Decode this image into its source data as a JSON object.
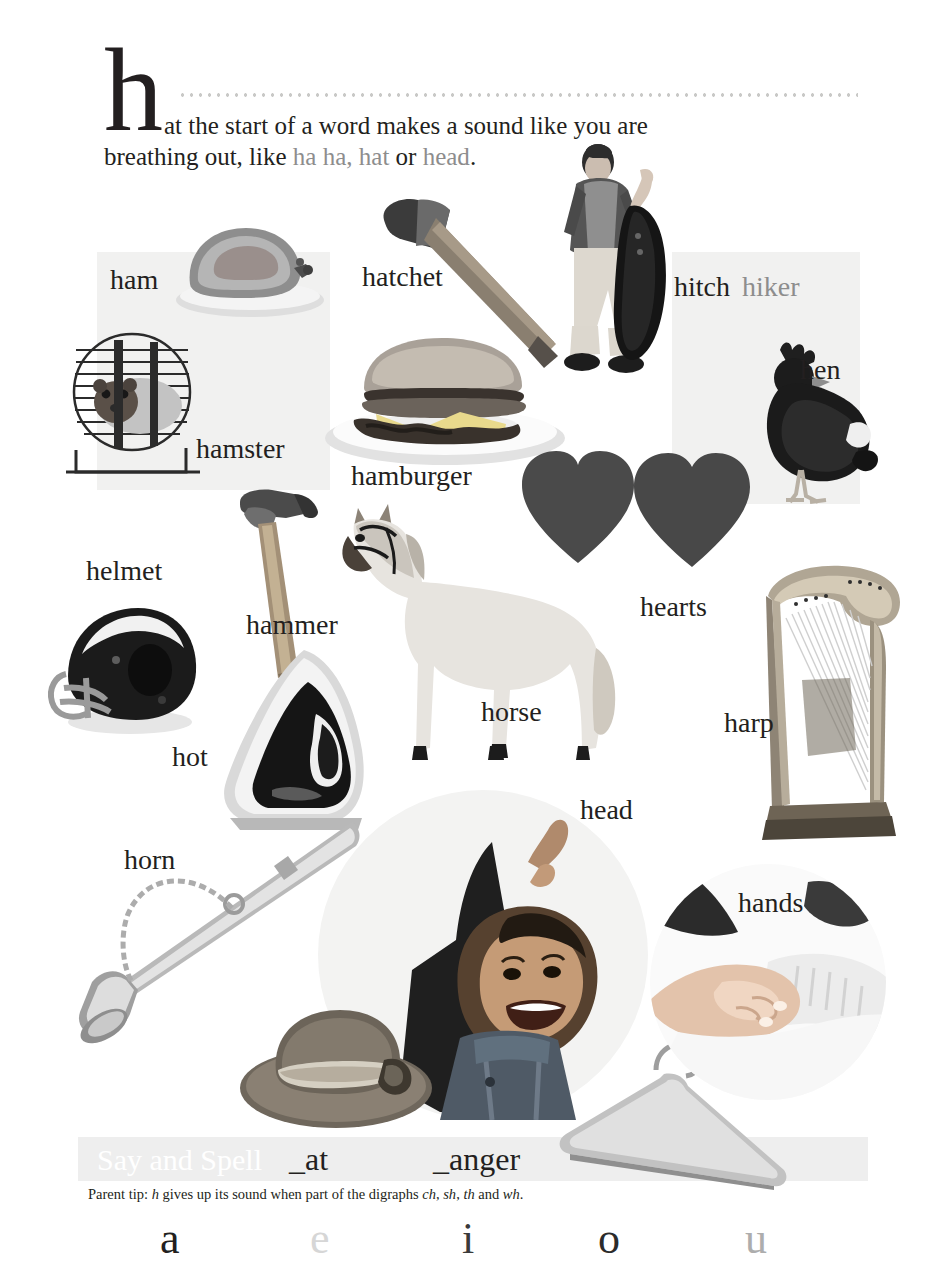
{
  "header": {
    "dropcap": "h",
    "intro_line1": "at the start of a word makes a sound like you are",
    "intro_line2_a": "breathing out, like ",
    "intro_line2_hl1": "ha ha,",
    "intro_line2_b": " ",
    "intro_line2_hl2": "hat",
    "intro_line2_c": " or ",
    "intro_line2_hl3": "head",
    "intro_line2_d": "."
  },
  "labels": [
    {
      "id": "ham",
      "text": "ham"
    },
    {
      "id": "hatchet",
      "text": "hatchet"
    },
    {
      "id": "hitch",
      "text": "hitch"
    },
    {
      "id": "hiker",
      "text": "hiker"
    },
    {
      "id": "hen",
      "text": "hen"
    },
    {
      "id": "hamster",
      "text": "hamster"
    },
    {
      "id": "hamburger",
      "text": "hamburger"
    },
    {
      "id": "helmet",
      "text": "helmet"
    },
    {
      "id": "hammer",
      "text": "hammer"
    },
    {
      "id": "hearts",
      "text": "hearts"
    },
    {
      "id": "horse",
      "text": "horse"
    },
    {
      "id": "harp",
      "text": "harp"
    },
    {
      "id": "hot",
      "text": "hot"
    },
    {
      "id": "head",
      "text": "head"
    },
    {
      "id": "horn",
      "text": "horn"
    },
    {
      "id": "hands",
      "text": "hands"
    }
  ],
  "picture_names": [
    "ham",
    "hamster",
    "hatchet",
    "hamburger",
    "hitchhiker",
    "hen",
    "hearts",
    "helmet",
    "hammer",
    "iron-hot",
    "horse",
    "harp",
    "horn",
    "head-girl",
    "hat",
    "hanger",
    "hands-keyboard"
  ],
  "footer": {
    "say_and_spell": "Say and Spell",
    "blank_at": "_at",
    "blank_anger": "_anger",
    "parent_tip_prefix": "Parent tip: ",
    "parent_tip_h": "h",
    "parent_tip_mid": " gives up its sound when part of the digraphs ",
    "parent_tip_d1": "ch",
    "parent_tip_sep1": ", ",
    "parent_tip_d2": "sh",
    "parent_tip_sep2": ", ",
    "parent_tip_d3": "th",
    "parent_tip_sep3": " and ",
    "parent_tip_d4": "wh",
    "parent_tip_end": "."
  },
  "vowels": [
    {
      "letter": "a",
      "tone": "#231f20"
    },
    {
      "letter": "e",
      "tone": "#d6d6d6"
    },
    {
      "letter": "i",
      "tone": "#3a3a3a"
    },
    {
      "letter": "o",
      "tone": "#2b2b2b"
    },
    {
      "letter": "u",
      "tone": "#adadad"
    }
  ],
  "colors": {
    "ink": "#231f20",
    "muted": "#8d8d8d",
    "panel": "#f1f1f0",
    "band": "#eeeeee",
    "heart": "#4a4a4a",
    "dots": "#c9c9c7",
    "page": "#ffffff"
  }
}
